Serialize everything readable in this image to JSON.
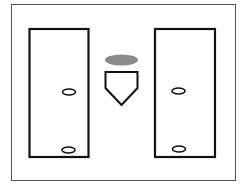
{
  "diagram": {
    "title": "",
    "colors": {
      "background": "#ffffff",
      "frame": "#555555",
      "stroke": "#111111",
      "marker_fill": "#8a8a8a"
    },
    "elements": [
      {
        "id": "left-batters-box",
        "type": "rectangle"
      },
      {
        "id": "right-batters-box",
        "type": "rectangle"
      },
      {
        "id": "home-plate",
        "type": "pentagon"
      },
      {
        "id": "catcher-marker",
        "type": "filled-ellipse"
      },
      {
        "id": "left-box-mark-upper",
        "type": "ellipse"
      },
      {
        "id": "left-box-mark-lower",
        "type": "ellipse"
      },
      {
        "id": "right-box-mark-upper",
        "type": "ellipse"
      },
      {
        "id": "right-box-mark-lower",
        "type": "ellipse"
      }
    ]
  }
}
